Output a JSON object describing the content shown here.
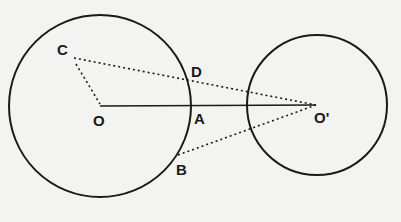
{
  "diagram": {
    "type": "geometry-two-circles",
    "colors": {
      "background": "#f3f3f1",
      "stroke": "#1a1a1a"
    },
    "circles": [
      {
        "name": "circle-O",
        "center": "O",
        "cx": 100,
        "cy": 106,
        "r": 91
      },
      {
        "name": "circle-O-prime",
        "center": "O'",
        "cx": 317,
        "cy": 105,
        "r": 70
      }
    ],
    "points": {
      "C": {
        "label": "C",
        "x": 74,
        "y": 58
      },
      "O": {
        "label": "O",
        "x": 100,
        "y": 106
      },
      "D": {
        "label": "D",
        "x": 190,
        "y": 80
      },
      "A": {
        "label": "A",
        "x": 191,
        "y": 106
      },
      "B": {
        "label": "B",
        "x": 178,
        "y": 155
      },
      "O_prime": {
        "label": "O'",
        "x": 316,
        "y": 105
      }
    },
    "segments": [
      {
        "from": "O",
        "to": "O'",
        "style": "solid",
        "note": "line of centers through A"
      },
      {
        "from": "C",
        "to": "O'",
        "style": "dotted",
        "note": "through D"
      },
      {
        "from": "C",
        "to": "O",
        "style": "dotted"
      },
      {
        "from": "B",
        "to": "O'",
        "style": "dotted"
      }
    ]
  }
}
